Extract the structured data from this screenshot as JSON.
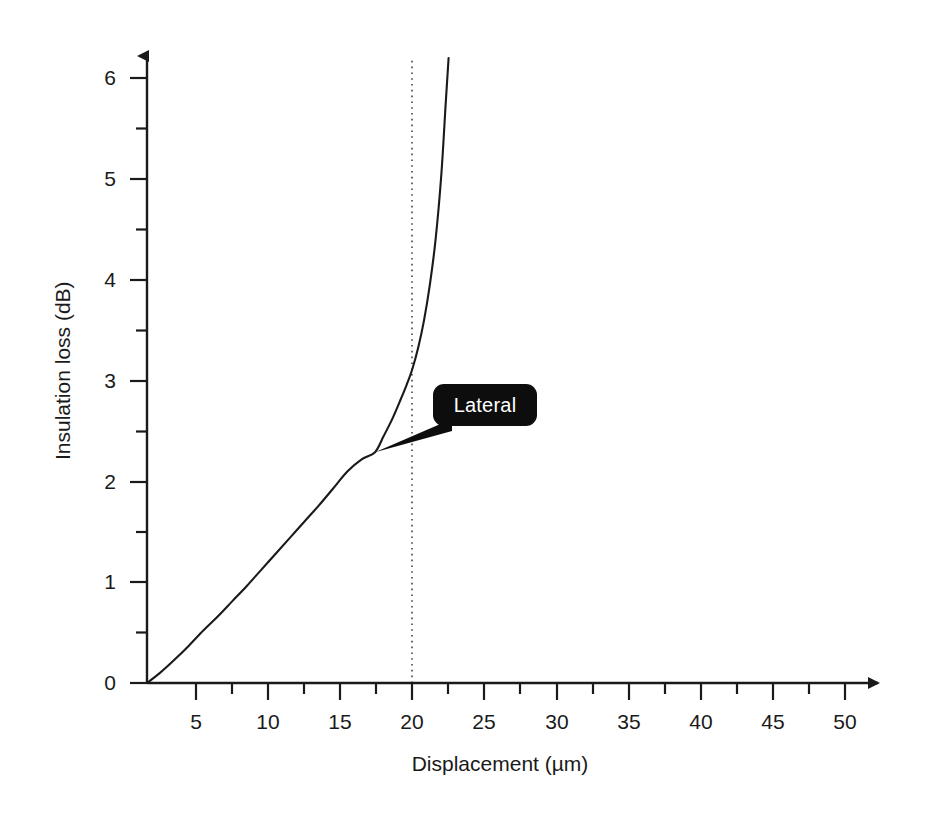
{
  "figure": {
    "background_color": "#ffffff",
    "line_color": "#1a1a1a"
  },
  "chart_data": {
    "type": "line",
    "title": "",
    "subtitle": "",
    "xlabel": "Displacement (µm)",
    "ylabel": "Insulation loss (dB)",
    "xlim": [
      1.6,
      51.6
    ],
    "ylim": [
      0,
      6.25
    ],
    "grid": false,
    "legend": null,
    "x_major_ticks": [
      5,
      10,
      15,
      20,
      25,
      30,
      35,
      40,
      45,
      50
    ],
    "x_minor_ticks": [
      7.5,
      12.5,
      17.5,
      22.5,
      27.5,
      32.5,
      37.5,
      42.5,
      47.5
    ],
    "x_tick_labels": [
      "5",
      "10",
      "15",
      "20",
      "25",
      "30",
      "35",
      "40",
      "45",
      "50"
    ],
    "y_major_ticks": [
      0,
      1,
      2,
      3,
      4,
      5,
      6
    ],
    "y_minor_ticks": [
      0.5,
      1.5,
      2.5,
      3.5,
      4.5,
      5.5
    ],
    "y_tick_labels": [
      "0",
      "1",
      "2",
      "3",
      "4",
      "5",
      "6"
    ],
    "axes_style": "arrowed-L",
    "annotations": [
      {
        "name": "lateral-callout",
        "label": "Lateral",
        "text_color": "#ffffff",
        "box_color": "#0d0d0d",
        "points_to": [
          17.4,
          2.29
        ]
      },
      {
        "name": "asymptote-guide",
        "label": "",
        "style": "dotted-vertical",
        "x": 20
      }
    ],
    "series": [
      {
        "name": "Lateral insulation loss",
        "x": [
          1.6,
          2.5,
          3.5,
          4.5,
          5.5,
          6.5,
          7.5,
          8.5,
          9.5,
          10.5,
          11.5,
          12.5,
          13.5,
          14.5,
          15.5,
          16.5,
          17.4,
          18.0,
          18.6,
          19.2,
          19.6,
          20.0,
          20.4,
          20.8,
          21.2,
          21.6,
          22.0,
          22.3,
          22.5
        ],
        "y": [
          0.0,
          0.1,
          0.23,
          0.37,
          0.52,
          0.66,
          0.81,
          0.96,
          1.12,
          1.28,
          1.44,
          1.6,
          1.76,
          1.93,
          2.1,
          2.22,
          2.29,
          2.45,
          2.62,
          2.82,
          2.96,
          3.12,
          3.33,
          3.6,
          3.95,
          4.4,
          5.05,
          5.75,
          6.2
        ]
      }
    ]
  }
}
